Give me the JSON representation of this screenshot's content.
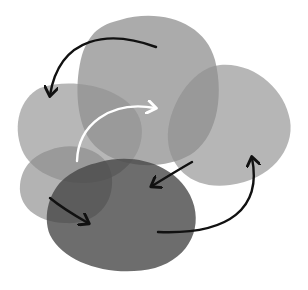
{
  "canvas": {
    "width": 308,
    "height": 290,
    "background": "#ffffff"
  },
  "blobs": [
    {
      "id": "top-center",
      "color": "#8a8a8a",
      "opacity": 0.75
    },
    {
      "id": "right",
      "color": "#8f8f8f",
      "opacity": 0.65
    },
    {
      "id": "left-upper",
      "color": "#8e8e8e",
      "opacity": 0.65
    },
    {
      "id": "left-lower",
      "color": "#8a8a8a",
      "opacity": 0.65
    },
    {
      "id": "bottom-center",
      "color": "#4a4a4a",
      "opacity": 0.8
    }
  ],
  "arrows": [
    {
      "id": "top-to-left",
      "color": "#111111"
    },
    {
      "id": "white-center",
      "color": "#ffffff"
    },
    {
      "id": "right-to-bottom",
      "color": "#111111"
    },
    {
      "id": "bottom-to-right",
      "color": "#111111"
    },
    {
      "id": "left-to-bottom",
      "color": "#111111"
    }
  ]
}
